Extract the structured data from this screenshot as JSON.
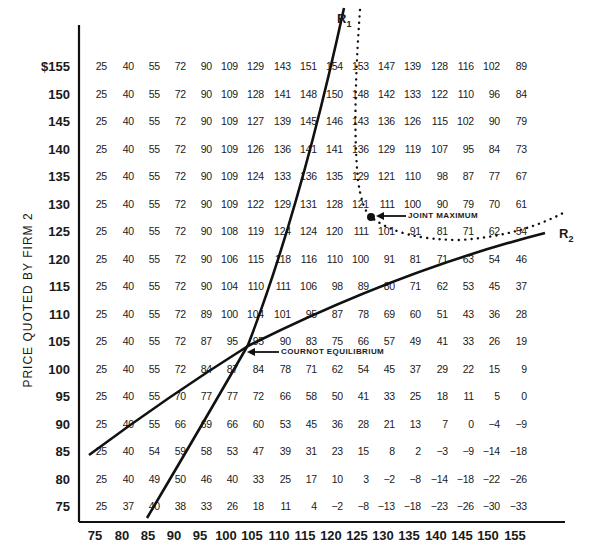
{
  "chart_data": {
    "type": "table",
    "title": "",
    "ylabel": "PRICE QUOTED BY FIRM 2",
    "xlabel": "",
    "currency_prefix": "$",
    "x_prices": [
      75,
      80,
      85,
      90,
      95,
      100,
      105,
      110,
      115,
      120,
      125,
      130,
      135,
      140,
      145,
      150,
      155
    ],
    "y_prices": [
      155,
      150,
      145,
      140,
      135,
      130,
      125,
      120,
      115,
      110,
      105,
      100,
      95,
      90,
      85,
      80,
      75
    ],
    "y_tick_labels": [
      "$155",
      "150",
      "145",
      "140",
      "135",
      "130",
      "125",
      "120",
      "115",
      "110",
      "105",
      "100",
      "95",
      "90",
      "85",
      "80",
      "75"
    ],
    "x_tick_labels": [
      "75",
      "80",
      "85",
      "90",
      "95",
      "100",
      "105",
      "110",
      "115",
      "120",
      "125",
      "130",
      "135",
      "140",
      "145",
      "150",
      "155"
    ],
    "values": [
      [
        25,
        40,
        55,
        72,
        90,
        109,
        129,
        143,
        151,
        154,
        153,
        147,
        139,
        128,
        116,
        102,
        89
      ],
      [
        25,
        40,
        55,
        72,
        90,
        109,
        128,
        141,
        148,
        150,
        148,
        142,
        133,
        122,
        110,
        96,
        84
      ],
      [
        25,
        40,
        55,
        72,
        90,
        109,
        127,
        139,
        145,
        146,
        143,
        136,
        126,
        115,
        102,
        90,
        79
      ],
      [
        25,
        40,
        55,
        72,
        90,
        109,
        126,
        136,
        141,
        141,
        136,
        129,
        119,
        107,
        95,
        84,
        73
      ],
      [
        25,
        40,
        55,
        72,
        90,
        109,
        124,
        133,
        136,
        135,
        129,
        121,
        110,
        98,
        87,
        77,
        67
      ],
      [
        25,
        40,
        55,
        72,
        90,
        109,
        122,
        129,
        131,
        128,
        121,
        111,
        100,
        90,
        79,
        70,
        61
      ],
      [
        25,
        40,
        55,
        72,
        90,
        108,
        119,
        124,
        124,
        120,
        111,
        101,
        91,
        81,
        71,
        62,
        54
      ],
      [
        25,
        40,
        55,
        72,
        90,
        106,
        115,
        118,
        116,
        110,
        100,
        91,
        81,
        71,
        63,
        54,
        46
      ],
      [
        25,
        40,
        55,
        72,
        90,
        104,
        110,
        111,
        106,
        98,
        89,
        80,
        71,
        62,
        53,
        45,
        37
      ],
      [
        25,
        40,
        55,
        72,
        89,
        100,
        104,
        101,
        95,
        87,
        78,
        69,
        60,
        51,
        43,
        36,
        28
      ],
      [
        25,
        40,
        55,
        72,
        87,
        95,
        95,
        90,
        83,
        75,
        66,
        57,
        49,
        41,
        33,
        26,
        19
      ],
      [
        25,
        40,
        55,
        72,
        84,
        87,
        84,
        78,
        71,
        62,
        54,
        45,
        37,
        29,
        22,
        15,
        9
      ],
      [
        25,
        40,
        55,
        70,
        77,
        77,
        72,
        66,
        58,
        50,
        41,
        33,
        25,
        18,
        11,
        5,
        0
      ],
      [
        25,
        40,
        55,
        66,
        69,
        66,
        60,
        53,
        45,
        36,
        28,
        21,
        13,
        7,
        0,
        -4,
        -9
      ],
      [
        25,
        40,
        54,
        59,
        58,
        53,
        47,
        39,
        31,
        23,
        15,
        8,
        2,
        -3,
        -9,
        -14,
        -18
      ],
      [
        25,
        40,
        49,
        50,
        46,
        40,
        33,
        25,
        17,
        10,
        3,
        -2,
        -8,
        -14,
        -18,
        -22,
        -26
      ],
      [
        25,
        37,
        40,
        38,
        33,
        26,
        18,
        11,
        4,
        -2,
        -8,
        -13,
        -18,
        -23,
        -26,
        -30,
        -33
      ]
    ],
    "curves": [
      {
        "name": "R1",
        "style": "solid"
      },
      {
        "name": "R2",
        "style": "solid"
      },
      {
        "name": "joint-profit-contour",
        "style": "dotted"
      }
    ],
    "annotations": [
      {
        "text": "JOINT MAXIMUM",
        "at_x": 125,
        "at_y": 127
      },
      {
        "text": "COURNOT EQUILIBRIUM",
        "at_x": 105,
        "at_y": 102
      }
    ],
    "grid": false,
    "legend": "none"
  },
  "labels": {
    "r1_main": "R",
    "r1_sub": "1",
    "r2_main": "R",
    "r2_sub": "2",
    "joint_maximum": "JOINT MAXIMUM",
    "cournot_equilibrium": "COURNOT EQUILIBRIUM",
    "ylabel": "PRICE QUOTED BY FIRM 2"
  }
}
